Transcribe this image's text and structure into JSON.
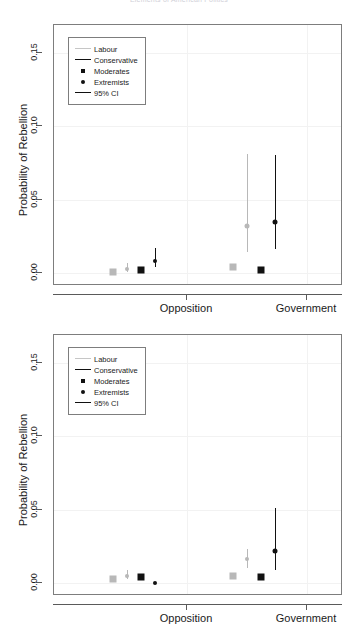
{
  "figure": {
    "title": "Elements of American Politics",
    "ylabel": "Probability of Rebellion"
  },
  "legend": {
    "items": [
      {
        "label": "Labour",
        "key": "line-grey",
        "color": "#c6c6c6"
      },
      {
        "label": "Conservative",
        "key": "line-dark",
        "color": "#111111"
      },
      {
        "label": "Moderates",
        "key": "square-dark",
        "color": "#111111"
      },
      {
        "label": "Extremists",
        "key": "dot-dark",
        "color": "#111111"
      },
      {
        "label": "95% CI",
        "key": "line-dark",
        "color": "#111111"
      }
    ]
  },
  "axes": {
    "yticks": [
      "0.00",
      "0.05",
      "0.10",
      "0.15"
    ],
    "ytick_values": [
      0.0,
      0.05,
      0.1,
      0.15
    ],
    "ylim": [
      -0.006,
      0.172
    ],
    "xticks": [
      "Opposition",
      "Government"
    ]
  },
  "chart_data": [
    {
      "type": "scatter",
      "panel": "top",
      "title": "",
      "xlabel": "",
      "ylabel": "Probability of Rebellion",
      "ylim": [
        -0.006,
        0.172
      ],
      "grid": true,
      "categories": [
        "Opposition",
        "Government"
      ],
      "legend_position": "top-left",
      "series": [
        {
          "name": "Labour Moderates",
          "party": "Labour",
          "wing": "Moderates",
          "marker": "square",
          "color": "#b8b8b8",
          "points": [
            {
              "category": "Opposition",
              "value": 0.001,
              "ci_low": 0.0,
              "ci_high": 0.002
            },
            {
              "category": "Government",
              "value": 0.004,
              "ci_low": 0.003,
              "ci_high": 0.006
            }
          ]
        },
        {
          "name": "Labour Extremists",
          "party": "Labour",
          "wing": "Extremists",
          "marker": "circle",
          "color": "#b8b8b8",
          "points": [
            {
              "category": "Opposition",
              "value": 0.003,
              "ci_low": 0.001,
              "ci_high": 0.007
            },
            {
              "category": "Government",
              "value": 0.032,
              "ci_low": 0.014,
              "ci_high": 0.081
            }
          ]
        },
        {
          "name": "Conservative Moderates",
          "party": "Conservative",
          "wing": "Moderates",
          "marker": "square",
          "color": "#111111",
          "points": [
            {
              "category": "Opposition",
              "value": 0.002,
              "ci_low": 0.001,
              "ci_high": 0.003
            },
            {
              "category": "Government",
              "value": 0.002,
              "ci_low": 0.001,
              "ci_high": 0.004
            }
          ]
        },
        {
          "name": "Conservative Extremists",
          "party": "Conservative",
          "wing": "Extremists",
          "marker": "circle",
          "color": "#111111",
          "points": [
            {
              "category": "Opposition",
              "value": 0.008,
              "ci_low": 0.004,
              "ci_high": 0.017
            },
            {
              "category": "Government",
              "value": 0.035,
              "ci_low": 0.016,
              "ci_high": 0.08
            }
          ]
        }
      ]
    },
    {
      "type": "scatter",
      "panel": "bottom",
      "title": "",
      "xlabel": "",
      "ylabel": "Probability of Rebellion",
      "ylim": [
        -0.006,
        0.172
      ],
      "grid": true,
      "categories": [
        "Opposition",
        "Government"
      ],
      "legend_position": "top-left",
      "series": [
        {
          "name": "Labour Moderates",
          "party": "Labour",
          "wing": "Moderates",
          "marker": "square",
          "color": "#b8b8b8",
          "points": [
            {
              "category": "Opposition",
              "value": 0.003,
              "ci_low": 0.002,
              "ci_high": 0.005
            },
            {
              "category": "Government",
              "value": 0.005,
              "ci_low": 0.003,
              "ci_high": 0.007
            }
          ]
        },
        {
          "name": "Labour Extremists",
          "party": "Labour",
          "wing": "Extremists",
          "marker": "circle",
          "color": "#b8b8b8",
          "points": [
            {
              "category": "Opposition",
              "value": 0.005,
              "ci_low": 0.003,
              "ci_high": 0.009
            },
            {
              "category": "Government",
              "value": 0.016,
              "ci_low": 0.01,
              "ci_high": 0.023
            }
          ]
        },
        {
          "name": "Conservative Moderates",
          "party": "Conservative",
          "wing": "Moderates",
          "marker": "square",
          "color": "#111111",
          "points": [
            {
              "category": "Opposition",
              "value": 0.004,
              "ci_low": 0.003,
              "ci_high": 0.006
            },
            {
              "category": "Government",
              "value": 0.004,
              "ci_low": 0.002,
              "ci_high": 0.005
            }
          ]
        },
        {
          "name": "Conservative Extremists",
          "party": "Conservative",
          "wing": "Extremists",
          "marker": "circle",
          "color": "#111111",
          "points": [
            {
              "category": "Opposition",
              "value": 0.0,
              "ci_low": 0.0,
              "ci_high": 0.001
            },
            {
              "category": "Government",
              "value": 0.022,
              "ci_low": 0.009,
              "ci_high": 0.051
            }
          ]
        }
      ]
    }
  ]
}
